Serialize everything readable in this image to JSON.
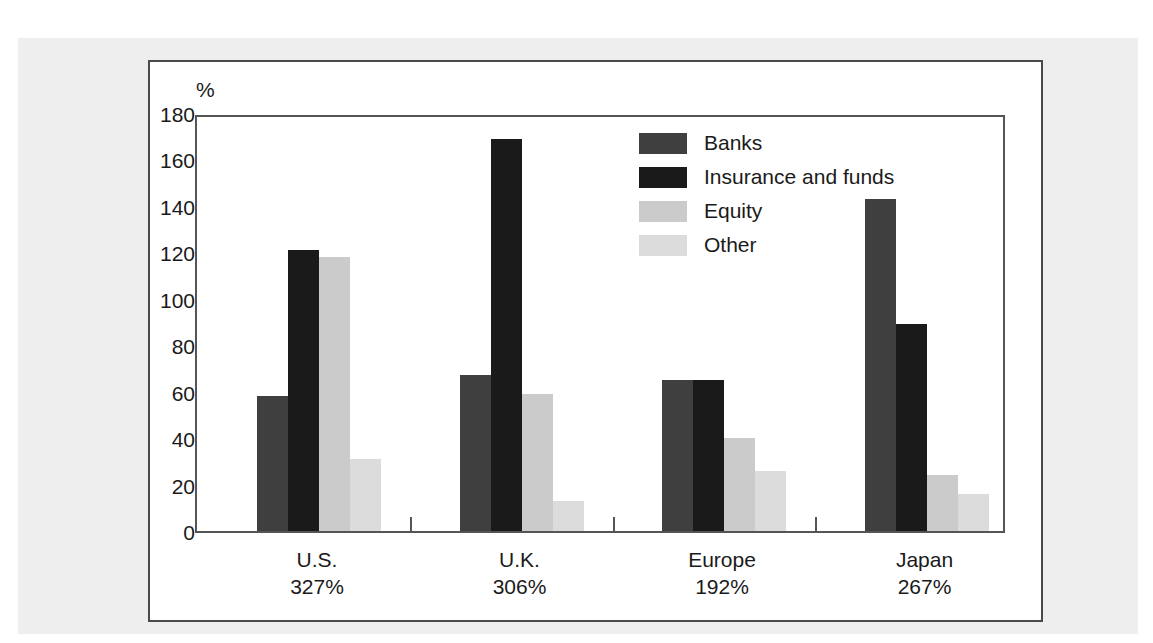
{
  "figure": {
    "unit_label": "%"
  },
  "legend": {
    "position": "inside-top-right",
    "entries": [
      {
        "label": "Banks",
        "color": "#3f3f3f"
      },
      {
        "label": "Insurance and funds",
        "color": "#1a1a1a"
      },
      {
        "label": "Equity",
        "color": "#cbcbcb"
      },
      {
        "label": "Other",
        "color": "#dcdcdc"
      }
    ]
  },
  "chart_data": {
    "type": "bar",
    "title": "",
    "xlabel": "",
    "ylabel": "%",
    "ylim": [
      0,
      180
    ],
    "yticks": [
      0,
      20,
      40,
      60,
      80,
      100,
      120,
      140,
      160,
      180
    ],
    "ytick_labels": [
      "0",
      "20",
      "40",
      "60",
      "80",
      "100",
      "120",
      "140",
      "160",
      "180"
    ],
    "grid": false,
    "categories": [
      "U.S.",
      "U.K.",
      "Europe",
      "Japan"
    ],
    "category_sublabels": [
      "327%",
      "306%",
      "192%",
      "267%"
    ],
    "series": [
      {
        "name": "Banks",
        "color": "#3f3f3f",
        "values": [
          58,
          67,
          65,
          143
        ]
      },
      {
        "name": "Insurance and funds",
        "color": "#1a1a1a",
        "values": [
          121,
          169,
          65,
          89
        ]
      },
      {
        "name": "Equity",
        "color": "#cbcbcb",
        "values": [
          118,
          59,
          40,
          24
        ]
      },
      {
        "name": "Other",
        "color": "#dcdcdc",
        "values": [
          31,
          13,
          26,
          16
        ]
      }
    ]
  },
  "xaxis": {
    "groups": [
      {
        "name": "U.S.",
        "value": "327%"
      },
      {
        "name": "U.K.",
        "value": "306%"
      },
      {
        "name": "Europe",
        "value": "192%"
      },
      {
        "name": "Japan",
        "value": "267%"
      }
    ]
  }
}
